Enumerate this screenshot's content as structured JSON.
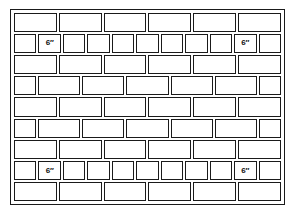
{
  "diagram": {
    "dimension_label": "6″",
    "stroke_color": "#1a1a1a",
    "fill_color": "#ffffff",
    "background_color": "#ffffff",
    "row_count": 9,
    "rows": [
      {
        "index": 1,
        "type": "stretcher-row",
        "bricks": [
          {
            "kind": "full",
            "label": ""
          },
          {
            "kind": "full",
            "label": ""
          },
          {
            "kind": "full",
            "label": ""
          },
          {
            "kind": "full",
            "label": ""
          },
          {
            "kind": "full",
            "label": ""
          },
          {
            "kind": "full",
            "label": ""
          }
        ]
      },
      {
        "index": 2,
        "type": "header-row",
        "bricks": [
          {
            "kind": "half",
            "label": ""
          },
          {
            "kind": "square",
            "label": "6″"
          },
          {
            "kind": "square",
            "label": ""
          },
          {
            "kind": "square",
            "label": ""
          },
          {
            "kind": "square",
            "label": ""
          },
          {
            "kind": "square",
            "label": ""
          },
          {
            "kind": "square",
            "label": ""
          },
          {
            "kind": "square",
            "label": ""
          },
          {
            "kind": "square",
            "label": ""
          },
          {
            "kind": "square",
            "label": "6″"
          },
          {
            "kind": "half",
            "label": ""
          }
        ]
      },
      {
        "index": 3,
        "type": "stretcher-row",
        "bricks": [
          {
            "kind": "full",
            "label": ""
          },
          {
            "kind": "full",
            "label": ""
          },
          {
            "kind": "full",
            "label": ""
          },
          {
            "kind": "full",
            "label": ""
          },
          {
            "kind": "full",
            "label": ""
          },
          {
            "kind": "full",
            "label": ""
          }
        ]
      },
      {
        "index": 4,
        "type": "offset-row",
        "bricks": [
          {
            "kind": "half",
            "label": ""
          },
          {
            "kind": "full",
            "label": ""
          },
          {
            "kind": "full",
            "label": ""
          },
          {
            "kind": "full",
            "label": ""
          },
          {
            "kind": "full",
            "label": ""
          },
          {
            "kind": "full",
            "label": ""
          },
          {
            "kind": "half",
            "label": ""
          }
        ]
      },
      {
        "index": 5,
        "type": "stretcher-row",
        "bricks": [
          {
            "kind": "full",
            "label": ""
          },
          {
            "kind": "full",
            "label": ""
          },
          {
            "kind": "full",
            "label": ""
          },
          {
            "kind": "full",
            "label": ""
          },
          {
            "kind": "full",
            "label": ""
          },
          {
            "kind": "full",
            "label": ""
          }
        ]
      },
      {
        "index": 6,
        "type": "offset-row",
        "bricks": [
          {
            "kind": "half",
            "label": ""
          },
          {
            "kind": "full",
            "label": ""
          },
          {
            "kind": "full",
            "label": ""
          },
          {
            "kind": "full",
            "label": ""
          },
          {
            "kind": "full",
            "label": ""
          },
          {
            "kind": "full",
            "label": ""
          },
          {
            "kind": "half",
            "label": ""
          }
        ]
      },
      {
        "index": 7,
        "type": "stretcher-row",
        "bricks": [
          {
            "kind": "full",
            "label": ""
          },
          {
            "kind": "full",
            "label": ""
          },
          {
            "kind": "full",
            "label": ""
          },
          {
            "kind": "full",
            "label": ""
          },
          {
            "kind": "full",
            "label": ""
          },
          {
            "kind": "full",
            "label": ""
          }
        ]
      },
      {
        "index": 8,
        "type": "header-row",
        "bricks": [
          {
            "kind": "half",
            "label": ""
          },
          {
            "kind": "square",
            "label": "6″"
          },
          {
            "kind": "square",
            "label": ""
          },
          {
            "kind": "square",
            "label": ""
          },
          {
            "kind": "square",
            "label": ""
          },
          {
            "kind": "square",
            "label": ""
          },
          {
            "kind": "square",
            "label": ""
          },
          {
            "kind": "square",
            "label": ""
          },
          {
            "kind": "square",
            "label": ""
          },
          {
            "kind": "square",
            "label": "6″"
          },
          {
            "kind": "half",
            "label": ""
          }
        ]
      },
      {
        "index": 9,
        "type": "stretcher-row",
        "bricks": [
          {
            "kind": "full",
            "label": ""
          },
          {
            "kind": "full",
            "label": ""
          },
          {
            "kind": "full",
            "label": ""
          },
          {
            "kind": "full",
            "label": ""
          },
          {
            "kind": "full",
            "label": ""
          },
          {
            "kind": "full",
            "label": ""
          }
        ]
      }
    ]
  }
}
